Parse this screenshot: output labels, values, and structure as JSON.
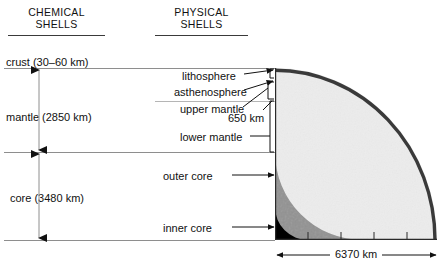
{
  "diagram": {
    "title_columns": {
      "chemical": {
        "line1": "CHEMICAL",
        "line2": "SHELLS"
      },
      "physical": {
        "line1": "PHYSICAL",
        "line2": "SHELLS"
      }
    },
    "chemical_shells": [
      {
        "label": "crust (30–60 km)"
      },
      {
        "label": "mantle (2850 km)"
      },
      {
        "label": "core (3480 km)"
      }
    ],
    "physical_shells": [
      {
        "label": "lithosphere"
      },
      {
        "label": "asthenosphere"
      },
      {
        "label": "upper mantle"
      },
      {
        "label": "lower mantle"
      },
      {
        "label": "outer core"
      },
      {
        "label": "inner core"
      }
    ],
    "depth_annotation": {
      "label": "650 km"
    },
    "scale_bar": {
      "label": "6370 km"
    },
    "colors": {
      "mantle": "#ececec",
      "outer_core": "#919191",
      "inner_core": "#000000",
      "crust_rim": "#3a3a3a",
      "rule": "#8e8e8e",
      "text": "#111111"
    }
  }
}
